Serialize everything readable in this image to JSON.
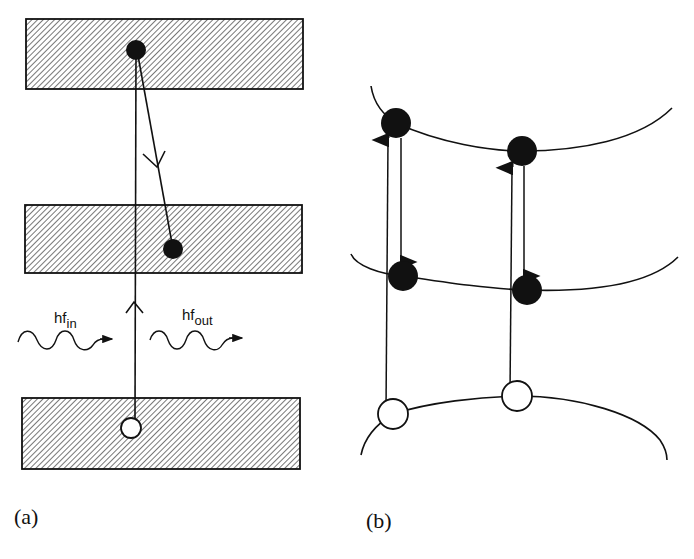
{
  "figure": {
    "panels": [
      {
        "id": "a",
        "label": "(a)",
        "bands": [
          {
            "name": "upper-band",
            "x": 26,
            "y": 19,
            "w": 277,
            "h": 70
          },
          {
            "name": "middle-band",
            "x": 25,
            "y": 205,
            "w": 277,
            "h": 68
          },
          {
            "name": "lower-band",
            "x": 22,
            "y": 398,
            "w": 278,
            "h": 71
          }
        ],
        "electrons": [
          {
            "name": "excited-electron",
            "cx": 136,
            "cy": 50,
            "r": 10
          },
          {
            "name": "relaxed-electron",
            "cx": 173,
            "cy": 249,
            "r": 10
          }
        ],
        "holes": [
          {
            "name": "hole",
            "cx": 131,
            "cy": 428,
            "r": 10
          }
        ],
        "photons": {
          "incoming": {
            "label_main": "hf",
            "label_sub": "in"
          },
          "outgoing": {
            "label_main": "hf",
            "label_sub": "out"
          }
        }
      },
      {
        "id": "b",
        "label": "(b)",
        "bands": [
          {
            "name": "upper-band-curve"
          },
          {
            "name": "middle-band-curve"
          },
          {
            "name": "lower-band-curve"
          }
        ],
        "electrons": [
          {
            "name": "electron-upper-left",
            "cx": 396,
            "cy": 123,
            "r": 15
          },
          {
            "name": "electron-upper-right",
            "cx": 522,
            "cy": 151,
            "r": 15
          },
          {
            "name": "electron-middle-left",
            "cx": 403,
            "cy": 276,
            "r": 15
          },
          {
            "name": "electron-middle-right",
            "cx": 527,
            "cy": 290,
            "r": 15
          }
        ],
        "holes": [
          {
            "name": "hole-left",
            "cx": 393,
            "cy": 414,
            "r": 15
          },
          {
            "name": "hole-right",
            "cx": 517,
            "cy": 396,
            "r": 15
          }
        ]
      }
    ],
    "colors": {
      "stroke": "#111111",
      "hatch": "#555555",
      "background": "#ffffff"
    }
  }
}
